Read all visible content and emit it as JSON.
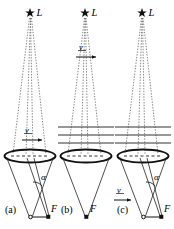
{
  "figure": {
    "type": "physics-optics-diagram",
    "panels": [
      {
        "id": "a",
        "panel_label": "(a)",
        "star_label": "L",
        "focus_label": "F",
        "angle_label": "α",
        "velocity_label": "v",
        "velocity_position": "above-lens",
        "velocity_direction": "right",
        "has_medium_lines": false,
        "has_angle": true,
        "has_tilted_ray": true,
        "star_icon": "star-icon",
        "cone_apex": "F"
      },
      {
        "id": "b",
        "panel_label": "(b)",
        "star_label": "L",
        "focus_label": "F",
        "angle_label": "",
        "velocity_label": "v",
        "velocity_position": "upper-beam",
        "velocity_direction": "right",
        "has_medium_lines": true,
        "medium_line_count": 3,
        "has_angle": false,
        "has_tilted_ray": false,
        "star_icon": "star-icon",
        "cone_apex": "F"
      },
      {
        "id": "c",
        "panel_label": "(c)",
        "star_label": "L",
        "focus_label": "F",
        "angle_label": "α",
        "velocity_label": "v",
        "velocity_position": "bottom-left",
        "velocity_direction": "right",
        "has_medium_lines": true,
        "medium_line_count": 3,
        "has_angle": true,
        "has_tilted_ray": true,
        "star_icon": "star-icon",
        "cone_apex": "F"
      }
    ],
    "colors": {
      "ink": "#111111",
      "ray": "#555555",
      "medium_line": "#333333",
      "background": "#ffffff"
    }
  }
}
